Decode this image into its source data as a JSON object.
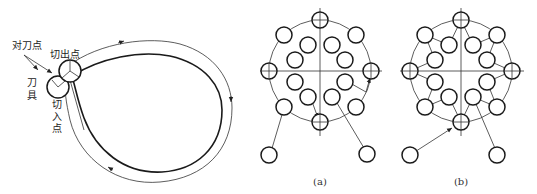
{
  "figure_left": {
    "labels": {
      "tool_setting_point": "对刀点",
      "exit_point": "切出点",
      "tool_line1": "刀",
      "tool_line2": "具",
      "entry_line1": "切",
      "entry_line2": "入",
      "entry_line3": "点"
    },
    "description": "Tool path around a teardrop-shaped contour: tool setting point, cut-in point, cut-out point"
  },
  "figure_a": {
    "caption": "(a)",
    "outer_ring_holes": 8,
    "inner_ring_holes": 8,
    "description": "Hole pattern on bolt circle with unoptimized drilling path"
  },
  "figure_b": {
    "caption": "(b)",
    "outer_ring_holes": 8,
    "inner_ring_holes": 8,
    "description": "Hole pattern on bolt circle with optimized zig-zag drilling path"
  },
  "colors": {
    "line": "#1a1a1a",
    "background": "#ffffff"
  }
}
